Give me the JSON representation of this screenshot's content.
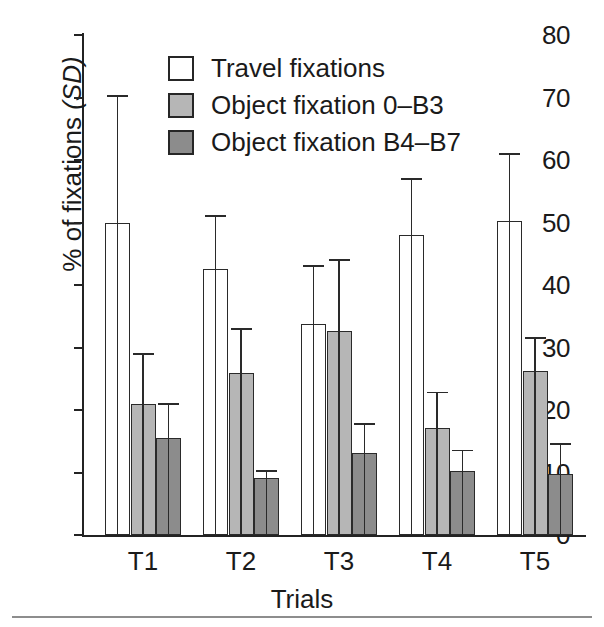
{
  "chart_data": {
    "type": "bar",
    "title": "",
    "xlabel": "Trials",
    "ylabel": "% of fixations (SD)",
    "ylabel_main": "% of fixations",
    "ylabel_italic": "(SD)",
    "categories": [
      "T1",
      "T2",
      "T3",
      "T4",
      "T5"
    ],
    "ylim": [
      0,
      80
    ],
    "yticks": [
      0,
      10,
      20,
      30,
      40,
      50,
      60,
      70,
      80
    ],
    "grid": false,
    "legend_position": "top-center",
    "error_bars": "upper only (SD)",
    "series": [
      {
        "name": "Travel fixations",
        "color": "#ffffff",
        "values": [
          50.0,
          42.5,
          33.8,
          48.0,
          50.2
        ],
        "errors_upper": [
          70.2,
          51.0,
          43.0,
          57.0,
          61.0
        ]
      },
      {
        "name": "Object fixation 0–B3",
        "color": "#b6b6b6",
        "values": [
          21.0,
          26.0,
          32.7,
          17.1,
          26.3
        ],
        "errors_upper": [
          29.0,
          33.0,
          44.0,
          22.8,
          31.5
        ]
      },
      {
        "name": "Object fixation B4–B7",
        "color": "#8c8c8c",
        "values": [
          15.5,
          9.2,
          13.2,
          10.2,
          9.8
        ],
        "errors_upper": [
          21.0,
          10.2,
          17.8,
          13.5,
          14.5
        ]
      }
    ]
  },
  "axes": {
    "y_ticks": [
      "80",
      "70",
      "60",
      "50",
      "40",
      "30",
      "20",
      "10",
      "0"
    ],
    "y_title_main": "% of fixations ",
    "y_title_sd": "(SD)",
    "x_ticks": [
      "T1",
      "T2",
      "T3",
      "T4",
      "T5"
    ],
    "x_title": "Trials"
  },
  "legend": {
    "items": [
      {
        "label": "Travel fixations",
        "swatch": "travel"
      },
      {
        "label": "Object fixation 0–B3",
        "swatch": "light"
      },
      {
        "label": "Object fixation B4–B7",
        "swatch": "dark"
      }
    ]
  }
}
